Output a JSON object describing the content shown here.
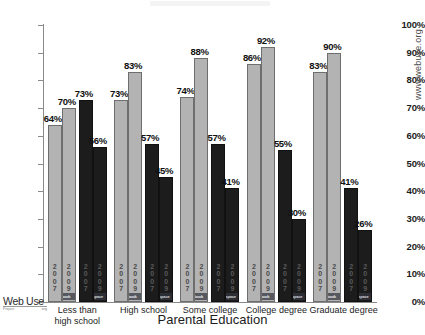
{
  "chart_data": {
    "type": "bar",
    "title": "",
    "xlabel": "Parental Education",
    "ylabel": "",
    "ylim": [
      0,
      100
    ],
    "ytick_labels": [
      "100%",
      "90%",
      "80%",
      "70%",
      "60%",
      "50%",
      "40%",
      "30%",
      "20%",
      "10%",
      "0%"
    ],
    "ytick_values": [
      100,
      90,
      80,
      70,
      60,
      50,
      40,
      30,
      20,
      10,
      0
    ],
    "grid": false,
    "legend_position": "in-bar",
    "categories": [
      "Less than high school",
      "High school",
      "Some college",
      "College degree",
      "Graduate degree"
    ],
    "series": [
      {
        "name": "facebook 2007",
        "brand": "facebook",
        "year": "2007",
        "color": "#b3b3b3",
        "values": [
          64,
          73,
          74,
          86,
          83
        ]
      },
      {
        "name": "facebook 2009",
        "brand": "facebook",
        "year": "2009",
        "color": "#b3b3b3",
        "values": [
          70,
          83,
          88,
          92,
          90
        ]
      },
      {
        "name": "myspace 2007",
        "brand": "myspace",
        "year": "2007",
        "color": "#1c1c1c",
        "values": [
          73,
          57,
          57,
          55,
          41
        ]
      },
      {
        "name": "myspace 2009",
        "brand": "myspace",
        "year": "2009",
        "color": "#1c1c1c",
        "values": [
          56,
          45,
          41,
          30,
          26
        ]
      }
    ],
    "value_labels": [
      [
        "64%",
        "70%",
        "73%",
        "56%"
      ],
      [
        "73%",
        "83%",
        "57%",
        "45%"
      ],
      [
        "74%",
        "88%",
        "57%",
        "41%"
      ],
      [
        "86%",
        "92%",
        "55%",
        "30%"
      ],
      [
        "83%",
        "90%",
        "41%",
        "26%"
      ]
    ],
    "in_bar_year_labels": [
      "2007",
      "2009",
      "2007",
      "2009"
    ],
    "brand_labels": {
      "facebook": "facebook",
      "myspace": "myspace"
    }
  },
  "branding": {
    "logo_main": "Web Use",
    "logo_sub_left": "Project",
    "logo_sub_right": ".org",
    "watermark": "www.webuse.org"
  }
}
